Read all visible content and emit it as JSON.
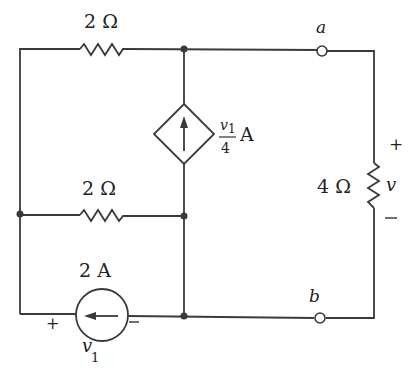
{
  "figure": {
    "type": "electrical-circuit",
    "colors": {
      "line": "#3a3a3a",
      "text": "#222222",
      "background": "#ffffff"
    }
  },
  "components": {
    "resistor_top": {
      "label": "2 Ω",
      "value_ohms": 2
    },
    "resistor_middle": {
      "label": "2 Ω",
      "value_ohms": 2
    },
    "resistor_load": {
      "label": "4 Ω",
      "value_ohms": 4,
      "voltage_label": "v",
      "plus": "+",
      "minus": "—"
    },
    "dependent_source": {
      "type": "current-controlled diamond",
      "label_num": "v",
      "label_num_sub": "1",
      "label_den": "4",
      "label_unit": "A",
      "direction": "up"
    },
    "current_source": {
      "label": "2 A",
      "value_amps": 2,
      "direction": "left",
      "voltage_label": "v",
      "voltage_sub": "1",
      "plus": "+",
      "minus": "—"
    }
  },
  "terminals": {
    "a": "a",
    "b": "b"
  }
}
